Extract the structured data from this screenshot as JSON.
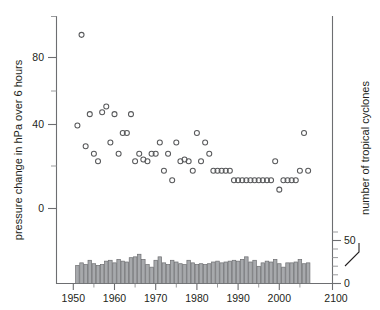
{
  "figure": {
    "name": "tropical-cyclone-pressure-change-scatter",
    "background": "#ffffff",
    "marker_color": "#58595b",
    "bar_fill": "#a7a9ac",
    "bar_stroke": "#6d6e71",
    "axis_color": "#6d6e71"
  },
  "chart_data": {
    "type": "scatter",
    "title": "",
    "xlabel": "",
    "ylabel": "pressure change in hPa over 6 hours",
    "y2label": "number of tropical cyclones",
    "xlim": [
      1944,
      2012
    ],
    "ylim": [
      -32,
      100
    ],
    "y2lim": [
      0,
      62
    ],
    "grid": false,
    "legend": null,
    "xticks": [
      1950,
      1960,
      1970,
      1980,
      1990,
      2000,
      2100
    ],
    "xtick_labels": [
      "1950",
      "1960",
      "1970",
      "1980",
      "1990",
      "2000",
      "2100"
    ],
    "xticks_minor": [
      1945,
      1955,
      1965,
      1975,
      1985,
      1995,
      2005
    ],
    "yticks": [
      0,
      40,
      80
    ],
    "ytick_labels": [
      "0",
      "40",
      "80"
    ],
    "yticks_minor": [
      20,
      60,
      100
    ],
    "y2ticks": [
      0,
      50
    ],
    "y2tick_labels": [
      "0",
      "50"
    ],
    "y2ticks_minor": [
      10,
      20,
      30,
      40,
      60
    ],
    "series": [
      {
        "name": "maximum pressure change",
        "marker": "open-circle",
        "x": [
          1951,
          1952,
          1953,
          1954,
          1955,
          1956,
          1957,
          1958,
          1959,
          1960,
          1961,
          1962,
          1963,
          1964,
          1965,
          1966,
          1967,
          1968,
          1969,
          1970,
          1971,
          1972,
          1973,
          1974,
          1975,
          1976,
          1977,
          1978,
          1979,
          1980,
          1981,
          1982,
          1983,
          1984,
          1985,
          1986,
          1987,
          1988,
          1989,
          1990,
          1991,
          1992,
          1993,
          1994,
          1995,
          1996,
          1997,
          1998,
          1999,
          2000,
          2001,
          2002,
          2003,
          2004,
          2005,
          2006,
          2007
        ],
        "y": [
          44,
          92,
          33,
          50,
          29,
          25,
          51,
          54,
          35,
          50,
          29,
          40,
          40,
          50,
          25,
          29,
          26,
          25,
          29,
          29,
          35,
          20,
          29,
          15,
          35,
          25,
          26,
          25,
          20,
          40,
          25,
          35,
          29,
          20,
          20,
          20,
          20,
          20,
          15,
          15,
          15,
          15,
          15,
          15,
          15,
          15,
          15,
          15,
          25,
          10,
          15,
          15,
          15,
          15,
          20,
          40,
          20
        ]
      },
      {
        "name": "number of tropical cyclones",
        "marker": "bar",
        "x": [
          1951,
          1952,
          1953,
          1954,
          1955,
          1956,
          1957,
          1958,
          1959,
          1960,
          1961,
          1962,
          1963,
          1964,
          1965,
          1966,
          1967,
          1968,
          1969,
          1970,
          1971,
          1972,
          1973,
          1974,
          1975,
          1976,
          1977,
          1978,
          1979,
          1980,
          1981,
          1982,
          1983,
          1984,
          1985,
          1986,
          1987,
          1988,
          1989,
          1990,
          1991,
          1992,
          1993,
          1994,
          1995,
          1996,
          1997,
          1998,
          1999,
          2000,
          2001,
          2002,
          2003,
          2004,
          2005,
          2006,
          2007
        ],
        "y": [
          21,
          24,
          22,
          27,
          23,
          21,
          22,
          26,
          27,
          24,
          28,
          26,
          25,
          30,
          31,
          34,
          28,
          22,
          19,
          27,
          31,
          24,
          22,
          27,
          25,
          23,
          22,
          27,
          24,
          22,
          23,
          22,
          23,
          25,
          26,
          24,
          25,
          26,
          27,
          26,
          28,
          31,
          25,
          27,
          20,
          24,
          26,
          25,
          28,
          23,
          19,
          24,
          24,
          25,
          28,
          23,
          24
        ]
      }
    ],
    "annotations": [
      {
        "kind": "outlier",
        "x": 1952,
        "y": 92,
        "note": "highest pressure change"
      }
    ]
  },
  "axes": {
    "left": {
      "label": "pressure change in hPa over 6 hours",
      "labels": [
        "0",
        "40",
        "80"
      ]
    },
    "right": {
      "label": "number of tropical cyclones",
      "labels": [
        "0",
        "50"
      ]
    },
    "bottom": {
      "labels": [
        "1950",
        "1960",
        "1970",
        "1980",
        "1990",
        "2000",
        "2100"
      ]
    }
  }
}
